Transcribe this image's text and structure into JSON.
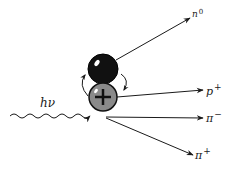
{
  "diagram": {
    "incoming": {
      "label": "hν",
      "type": "wavy-photon"
    },
    "nucleus": [
      {
        "name": "neutron",
        "fill": "#111111"
      },
      {
        "name": "proton",
        "fill": "#8a8a8a",
        "symbol": "+"
      }
    ],
    "products": [
      {
        "base": "n",
        "charge": "0"
      },
      {
        "base": "p",
        "charge": "+"
      },
      {
        "base": "π",
        "charge": "−"
      },
      {
        "base": "π",
        "charge": "+"
      }
    ],
    "colors": {
      "ink": "#1a1a1a",
      "proton": "#8a8a8a",
      "neutron": "#111111"
    }
  }
}
